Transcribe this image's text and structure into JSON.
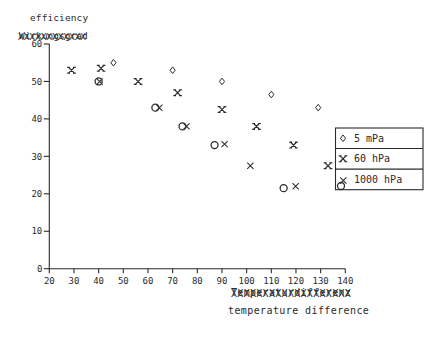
{
  "page": {
    "background": "#ffffff",
    "ink": "#2b2b2b"
  },
  "chart_data": {
    "type": "scatter",
    "title": "",
    "ylabel": "efficiency",
    "xlabel": "temperature difference",
    "xlim": [
      20,
      140
    ],
    "ylim": [
      0,
      60
    ],
    "xticks": [
      20,
      30,
      40,
      50,
      60,
      70,
      80,
      90,
      100,
      110,
      120,
      130,
      140
    ],
    "yticks": [
      0,
      10,
      20,
      30,
      40,
      50,
      60
    ],
    "grid": false,
    "legend_position": "right-middle",
    "series": [
      {
        "name": "5 mPa",
        "marker": "diamond",
        "points": [
          [
            46,
            55
          ],
          [
            70,
            53
          ],
          [
            90,
            50
          ],
          [
            110,
            46.5
          ],
          [
            129,
            43
          ]
        ]
      },
      {
        "name": "60 hPa",
        "marker": "serif-x",
        "points": [
          [
            29,
            53
          ],
          [
            41,
            53.5
          ],
          [
            56,
            50
          ],
          [
            72,
            47
          ],
          [
            90,
            42.5
          ],
          [
            104,
            38
          ],
          [
            119,
            33
          ],
          [
            133,
            27.5
          ]
        ]
      },
      {
        "name": "1000 hPa",
        "marker": "circle-x-overprint",
        "points": [
          [
            40,
            50
          ],
          [
            63,
            43
          ],
          [
            74,
            38
          ],
          [
            87,
            33
          ],
          [
            101.5,
            27.5
          ],
          [
            115,
            21.5
          ]
        ],
        "circle_visible": [
          true,
          true,
          true,
          true,
          false,
          true
        ],
        "x_drift_px": [
          [
            1,
            0
          ],
          [
            4,
            0
          ],
          [
            4,
            0
          ],
          [
            10,
            -1
          ],
          [
            0,
            0
          ],
          [
            12,
            -2
          ]
        ]
      }
    ],
    "overstrike_labels": {
      "top": {
        "base": "Wirkungsgrad",
        "overlay": "XXXXXXXXXXXX"
      },
      "bottom": {
        "base": "Temperaturdifferenz",
        "overlay": "XXXXXXXXXXXXXXXXXXX"
      }
    }
  },
  "legend": {
    "entries": [
      {
        "label": "5 mPa"
      },
      {
        "label": "60 hPa"
      },
      {
        "label": "1000 hPa"
      }
    ]
  }
}
